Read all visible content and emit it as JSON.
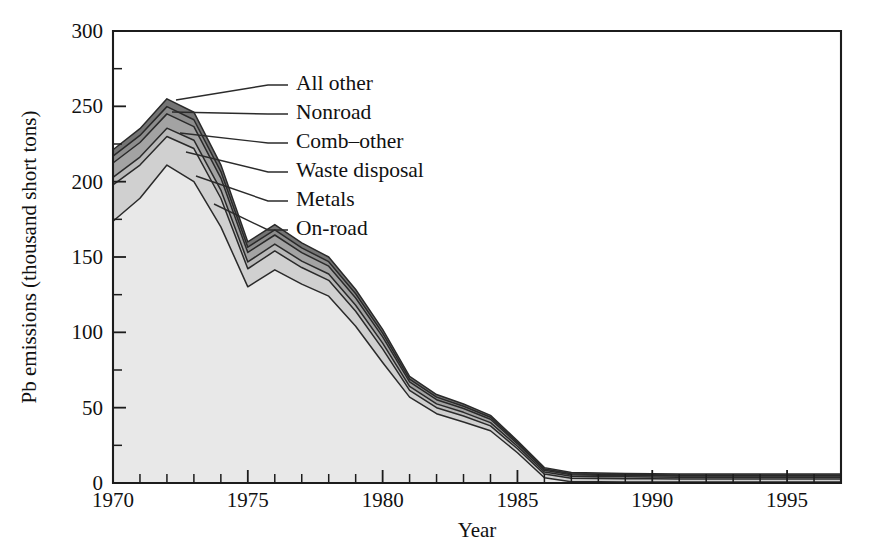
{
  "chart_data": {
    "type": "area",
    "stacked": true,
    "title": "",
    "xlabel": "Year",
    "ylabel": "Pb emissions (thousand short tons)",
    "xlim": [
      1970,
      1997
    ],
    "ylim": [
      0,
      300
    ],
    "y_ticks_major": [
      0,
      50,
      100,
      150,
      200,
      250,
      300
    ],
    "y_ticks_minor": [
      25,
      75,
      125,
      175,
      225,
      275
    ],
    "y_tick_labels": [
      "0",
      "50",
      "100",
      "150",
      "200",
      "250",
      "300"
    ],
    "x_ticks_major": [
      1970,
      1975,
      1980,
      1985,
      1990,
      1995
    ],
    "x_tick_labels": [
      "1970",
      "1975",
      "1980",
      "1985",
      "1990",
      "1995"
    ],
    "x_ticks_minor": [
      1971,
      1972,
      1973,
      1974,
      1976,
      1977,
      1978,
      1979,
      1981,
      1982,
      1983,
      1984,
      1986,
      1987,
      1988,
      1989,
      1991,
      1992,
      1993,
      1994,
      1996,
      1997
    ],
    "grid": false,
    "legend_position": "inline-leader-lines",
    "x": [
      1970,
      1971,
      1972,
      1973,
      1974,
      1975,
      1976,
      1977,
      1978,
      1979,
      1980,
      1981,
      1982,
      1983,
      1984,
      1985,
      1986,
      1987,
      1988,
      1989,
      1990,
      1991,
      1992,
      1993,
      1994,
      1995,
      1996,
      1997
    ],
    "series": [
      {
        "name": "On-road",
        "color": "#e8e8e8",
        "order_from_bottom": 1,
        "values": [
          173.7,
          189.0,
          211.0,
          200.0,
          170.0,
          130.2,
          141.5,
          132.0,
          124.0,
          104.0,
          80.0,
          57.0,
          46.0,
          40.5,
          34.7,
          20.1,
          3.5,
          0.9,
          0.8,
          0.7,
          0.7,
          0.6,
          0.6,
          0.6,
          0.6,
          0.6,
          0.6,
          0.6
        ]
      },
      {
        "name": "Metals",
        "color": "#d0d0d0",
        "order_from_bottom": 2,
        "values": [
          24.2,
          22.0,
          19.0,
          22.0,
          19.0,
          12.0,
          12.5,
          11.0,
          10.5,
          10.0,
          9.0,
          4.5,
          4.0,
          4.0,
          3.2,
          2.6,
          2.4,
          2.3,
          2.2,
          2.2,
          2.2,
          2.1,
          2.1,
          2.1,
          2.1,
          2.1,
          2.1,
          2.1
        ]
      },
      {
        "name": "Waste disposal",
        "color": "#b9b9b9",
        "order_from_bottom": 3,
        "values": [
          5.0,
          5.3,
          5.5,
          5.5,
          5.4,
          4.5,
          4.6,
          4.3,
          4.2,
          4.0,
          3.8,
          2.6,
          2.5,
          2.4,
          2.2,
          1.7,
          1.4,
          1.3,
          1.2,
          1.2,
          1.1,
          1.1,
          1.1,
          1.1,
          1.1,
          1.1,
          1.1,
          1.1
        ]
      },
      {
        "name": "Comb-other",
        "color": "#a3a3a3",
        "order_from_bottom": 4,
        "values": [
          9.5,
          9.7,
          9.5,
          9.0,
          8.0,
          6.3,
          6.0,
          5.6,
          5.2,
          4.8,
          4.2,
          3.0,
          2.8,
          2.5,
          2.2,
          1.6,
          1.2,
          1.0,
          0.9,
          0.9,
          0.9,
          0.8,
          0.8,
          0.8,
          0.8,
          0.8,
          0.8,
          0.8
        ]
      },
      {
        "name": "Nonroad",
        "color": "#8d8d8d",
        "order_from_bottom": 5,
        "values": [
          4.5,
          4.7,
          4.8,
          4.6,
          4.3,
          3.5,
          3.4,
          3.2,
          3.0,
          2.8,
          2.5,
          1.8,
          1.7,
          1.5,
          1.3,
          1.0,
          0.8,
          0.7,
          0.7,
          0.6,
          0.6,
          0.6,
          0.6,
          0.6,
          0.6,
          0.6,
          0.6,
          0.6
        ]
      },
      {
        "name": "All other",
        "color": "#747474",
        "order_from_bottom": 6,
        "values": [
          4.3,
          4.5,
          5.2,
          5.0,
          4.5,
          3.5,
          3.5,
          3.3,
          3.1,
          2.8,
          2.5,
          1.8,
          1.7,
          1.5,
          1.3,
          1.0,
          0.9,
          0.8,
          0.8,
          0.7,
          0.7,
          0.7,
          0.7,
          0.7,
          0.7,
          0.7,
          0.7,
          0.7
        ]
      }
    ]
  },
  "legend": {
    "items": [
      {
        "label": "All other"
      },
      {
        "label": "Nonroad"
      },
      {
        "label": "Comb–other"
      },
      {
        "label": "Waste disposal"
      },
      {
        "label": "Metals"
      },
      {
        "label": "On-road"
      }
    ]
  },
  "axes": {
    "x_title": "Year",
    "y_title": "Pb emissions (thousand short tons)"
  }
}
